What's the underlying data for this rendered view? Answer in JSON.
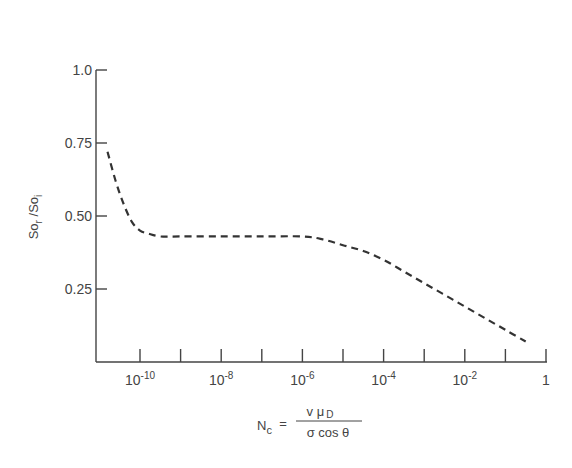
{
  "chart_data": {
    "type": "line",
    "title": "",
    "xlabel": "N_c = v μ_D / (σ cos θ)",
    "ylabel": "So_r / So_i",
    "xscale": "log",
    "xlim_log10": [
      -11.1,
      0
    ],
    "ylim": [
      0,
      1.0
    ],
    "grid": false,
    "legend": null,
    "x_ticks": [
      {
        "log10": -10,
        "label_base": "10",
        "label_exp": "-10"
      },
      {
        "log10": -8,
        "label_base": "10",
        "label_exp": "-8"
      },
      {
        "log10": -6,
        "label_base": "10",
        "label_exp": "-6"
      },
      {
        "log10": -4,
        "label_base": "10",
        "label_exp": "-4"
      },
      {
        "log10": -2,
        "label_base": "10",
        "label_exp": "-2"
      },
      {
        "log10": 0,
        "label_base": "1",
        "label_exp": ""
      }
    ],
    "x_minor_ticks_log10": [
      -9,
      -7,
      -5,
      -3,
      -1
    ],
    "y_ticks": [
      {
        "value": 1.0,
        "label": "1.0"
      },
      {
        "value": 0.75,
        "label": "0.75"
      },
      {
        "value": 0.5,
        "label": "0.50"
      },
      {
        "value": 0.25,
        "label": "0.25"
      }
    ],
    "series": [
      {
        "name": "So_r/So_i vs N_c",
        "style": "dashed",
        "color": "#333333",
        "x_log10": [
          -10.8,
          -10.6,
          -10.4,
          -10.2,
          -10.0,
          -9.8,
          -9.5,
          -9.0,
          -8.0,
          -7.0,
          -6.0,
          -5.5,
          -5.0,
          -4.5,
          -4.0,
          -3.5,
          -3.0,
          -2.5,
          -2.0,
          -1.5,
          -1.0,
          -0.5
        ],
        "y": [
          0.72,
          0.62,
          0.54,
          0.48,
          0.45,
          0.44,
          0.43,
          0.43,
          0.43,
          0.43,
          0.43,
          0.42,
          0.4,
          0.38,
          0.35,
          0.31,
          0.27,
          0.23,
          0.19,
          0.15,
          0.11,
          0.07
        ]
      }
    ]
  },
  "labels": {
    "y_title_main": "So",
    "y_title_sub1": "r",
    "y_title_slash": " /So",
    "y_title_sub2": "i",
    "x_title_lhs": "N",
    "x_title_lhs_sub": "c",
    "x_title_eq": "=",
    "x_title_num": "v μ",
    "x_title_num_sub": "D",
    "x_title_den": "σ cos θ"
  }
}
